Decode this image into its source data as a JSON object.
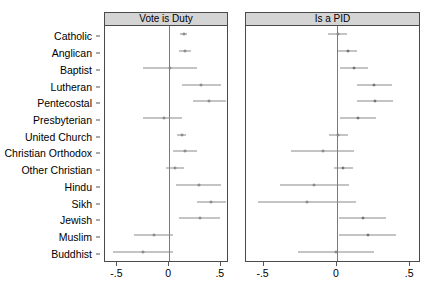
{
  "figure": {
    "type": "coefficient-plot",
    "categories": [
      "Catholic",
      "Anglican",
      "Baptist",
      "Lutheran",
      "Pentecostal",
      "Presbyterian",
      "United Church",
      "Christian Orthodox",
      "Other Christian",
      "Hindu",
      "Sikh",
      "Jewish",
      "Muslim",
      "Buddhist"
    ],
    "xticks": [
      "-.5",
      "0",
      ".5"
    ],
    "xtick_values": [
      -0.5,
      0,
      0.5
    ],
    "xlim": [
      -0.62,
      0.56
    ],
    "reference_line": 0
  },
  "panels": [
    {
      "title": "Vote is Duty",
      "estimates": [
        0.14,
        0.155,
        0.005,
        0.31,
        0.39,
        -0.045,
        0.12,
        0.155,
        0.055,
        0.285,
        0.41,
        0.295,
        -0.15,
        -0.255
      ],
      "ci_low": [
        0.105,
        0.1,
        -0.255,
        0.12,
        0.23,
        -0.25,
        0.075,
        0.04,
        -0.03,
        0.07,
        0.27,
        0.1,
        -0.335,
        -0.545
      ],
      "ci_high": [
        0.175,
        0.21,
        0.27,
        0.5,
        0.55,
        0.12,
        0.165,
        0.27,
        0.14,
        0.5,
        0.55,
        0.49,
        0.035,
        0.04
      ]
    },
    {
      "title": "Is a PID",
      "estimates": [
        0.005,
        0.075,
        0.115,
        0.255,
        0.26,
        0.145,
        0.01,
        -0.095,
        0.045,
        -0.155,
        -0.205,
        0.175,
        0.21,
        -0.005
      ],
      "ci_low": [
        -0.06,
        0.01,
        0.02,
        0.135,
        0.14,
        0.02,
        -0.055,
        -0.31,
        -0.02,
        -0.39,
        -0.54,
        0.015,
        0.015,
        -0.265
      ],
      "ci_high": [
        0.07,
        0.14,
        0.21,
        0.375,
        0.38,
        0.27,
        0.075,
        0.12,
        0.11,
        0.08,
        0.13,
        0.335,
        0.405,
        0.255
      ]
    }
  ]
}
